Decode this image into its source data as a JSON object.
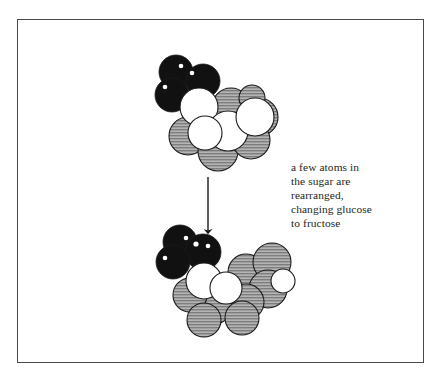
{
  "figure": {
    "name": "glucose-to-fructose-rearrangement",
    "frame": {
      "border_color": "#4a4a4a",
      "background": "#ffffff"
    },
    "caption": {
      "lines": [
        "a few atoms in",
        "the sugar are",
        "rearranged,",
        "changing glucose",
        "to fructose"
      ],
      "full_text": "a few atoms in the sugar are rearranged, changing glucose to fructose",
      "color": "#231f20"
    },
    "arrow": {
      "name": "downward-transformation-arrow",
      "direction": "down",
      "color": "#1a1a1a",
      "x": 208,
      "y_start": 177,
      "y_end": 231
    },
    "palette": {
      "atom_black": "#111111",
      "atom_white": "#ffffff",
      "atom_gray": "#9a9a9a",
      "atom_gray_hatch": "#6e6e6e",
      "outline": "#1a1a1a",
      "highlight": "#ffffff"
    },
    "molecules": [
      {
        "name": "glucose-molecule",
        "label": "glucose",
        "position": "top",
        "atoms": [
          {
            "type": "black",
            "cx": 176,
            "cy": 72,
            "r": 17,
            "highlights": [
              [
                181,
                66,
                2.3
              ]
            ]
          },
          {
            "type": "black",
            "cx": 203,
            "cy": 81,
            "r": 17,
            "highlights": [
              [
                192,
                73,
                2.3
              ]
            ]
          },
          {
            "type": "black",
            "cx": 172,
            "cy": 95,
            "r": 17,
            "highlights": [
              [
                165,
                87,
                2.3
              ]
            ]
          },
          {
            "type": "gray",
            "cx": 231,
            "cy": 107,
            "r": 19
          },
          {
            "type": "gray",
            "cx": 259,
            "cy": 117,
            "r": 19
          },
          {
            "type": "gray",
            "cx": 252,
            "cy": 98,
            "r": 13
          },
          {
            "type": "gray",
            "cx": 188,
            "cy": 136,
            "r": 19
          },
          {
            "type": "gray",
            "cx": 218,
            "cy": 151,
            "r": 20
          },
          {
            "type": "gray",
            "cx": 251,
            "cy": 140,
            "r": 19
          },
          {
            "type": "white",
            "cx": 199,
            "cy": 107,
            "r": 19
          },
          {
            "type": "white",
            "cx": 228,
            "cy": 131,
            "r": 20
          },
          {
            "type": "white",
            "cx": 255,
            "cy": 117,
            "r": 19
          },
          {
            "type": "white",
            "cx": 205,
            "cy": 133,
            "r": 17
          }
        ]
      },
      {
        "name": "fructose-molecule",
        "label": "fructose",
        "position": "bottom",
        "atoms": [
          {
            "type": "black",
            "cx": 180,
            "cy": 242,
            "r": 17,
            "highlights": [
              [
                186,
                238,
                2.3
              ]
            ]
          },
          {
            "type": "black",
            "cx": 203,
            "cy": 252,
            "r": 18,
            "highlights": [
              [
                196,
                244,
                2.6
              ],
              [
                208,
                246,
                2.3
              ]
            ]
          },
          {
            "type": "black",
            "cx": 173,
            "cy": 262,
            "r": 17,
            "highlights": [
              [
                165,
                258,
                2.3
              ]
            ]
          },
          {
            "type": "gray",
            "cx": 246,
            "cy": 272,
            "r": 18
          },
          {
            "type": "gray",
            "cx": 272,
            "cy": 262,
            "r": 19
          },
          {
            "type": "gray",
            "cx": 268,
            "cy": 289,
            "r": 19
          },
          {
            "type": "gray",
            "cx": 246,
            "cy": 302,
            "r": 18
          },
          {
            "type": "gray",
            "cx": 212,
            "cy": 305,
            "r": 20
          },
          {
            "type": "gray",
            "cx": 190,
            "cy": 295,
            "r": 17
          },
          {
            "type": "gray",
            "cx": 204,
            "cy": 320,
            "r": 17
          },
          {
            "type": "gray",
            "cx": 242,
            "cy": 318,
            "r": 17
          },
          {
            "type": "white",
            "cx": 204,
            "cy": 281,
            "r": 18
          },
          {
            "type": "white",
            "cx": 226,
            "cy": 288,
            "r": 16
          },
          {
            "type": "white",
            "cx": 283,
            "cy": 281,
            "r": 12
          }
        ]
      }
    ]
  }
}
